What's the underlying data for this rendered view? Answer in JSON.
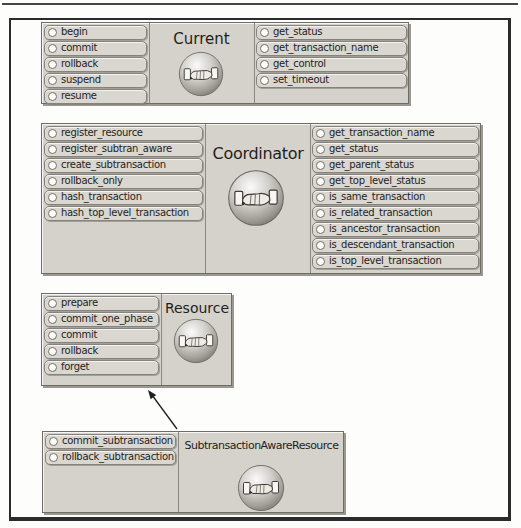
{
  "interfaces": [
    {
      "name": "Current",
      "left_methods": [
        "begin",
        "commit",
        "rollback",
        "suspend",
        "resume"
      ],
      "right_methods": [
        "get_status",
        "get_transaction_name",
        "get_control",
        "set_timeout"
      ]
    },
    {
      "name": "Coordinator",
      "left_methods": [
        "register_resource",
        "register_subtran_aware",
        "create_subtransaction",
        "rollback_only",
        "hash_transaction",
        "hash_top_level_transaction"
      ],
      "right_methods": [
        "get_transaction_name",
        "get_status",
        "get_parent_status",
        "get_top_level_status",
        "is_same_transaction",
        "is_related_transaction",
        "is_ancestor_transaction",
        "is_descendant_transaction",
        "is_top_level_transaction"
      ]
    },
    {
      "name": "Resource",
      "left_methods": [
        "prepare",
        "commit_one_phase",
        "commit",
        "rollback",
        "forget"
      ],
      "right_methods": []
    },
    {
      "name": "SubtransactionAwareResource",
      "left_methods": [
        "commit_subtransaction",
        "rollback_subtransaction"
      ],
      "right_methods": []
    }
  ],
  "relationships": [
    {
      "from": "SubtransactionAwareResource",
      "to": "Resource",
      "style": "arrow"
    }
  ],
  "icons": {
    "interface_badge": "handshake-icon",
    "method_marker": "radio-circle-icon"
  },
  "colors": {
    "page_background": "#fdfdfb",
    "frame_border": "#2b2b2b",
    "panel_fill": "#d5d2cb",
    "panel_border": "#6f6d68",
    "panel_shadow": "#9b988f",
    "pill_fill": "#dad7d0",
    "pill_border": "#85837d",
    "divider": "#8b8881",
    "text": "#24231f",
    "arrow": "#1f1f1d"
  }
}
